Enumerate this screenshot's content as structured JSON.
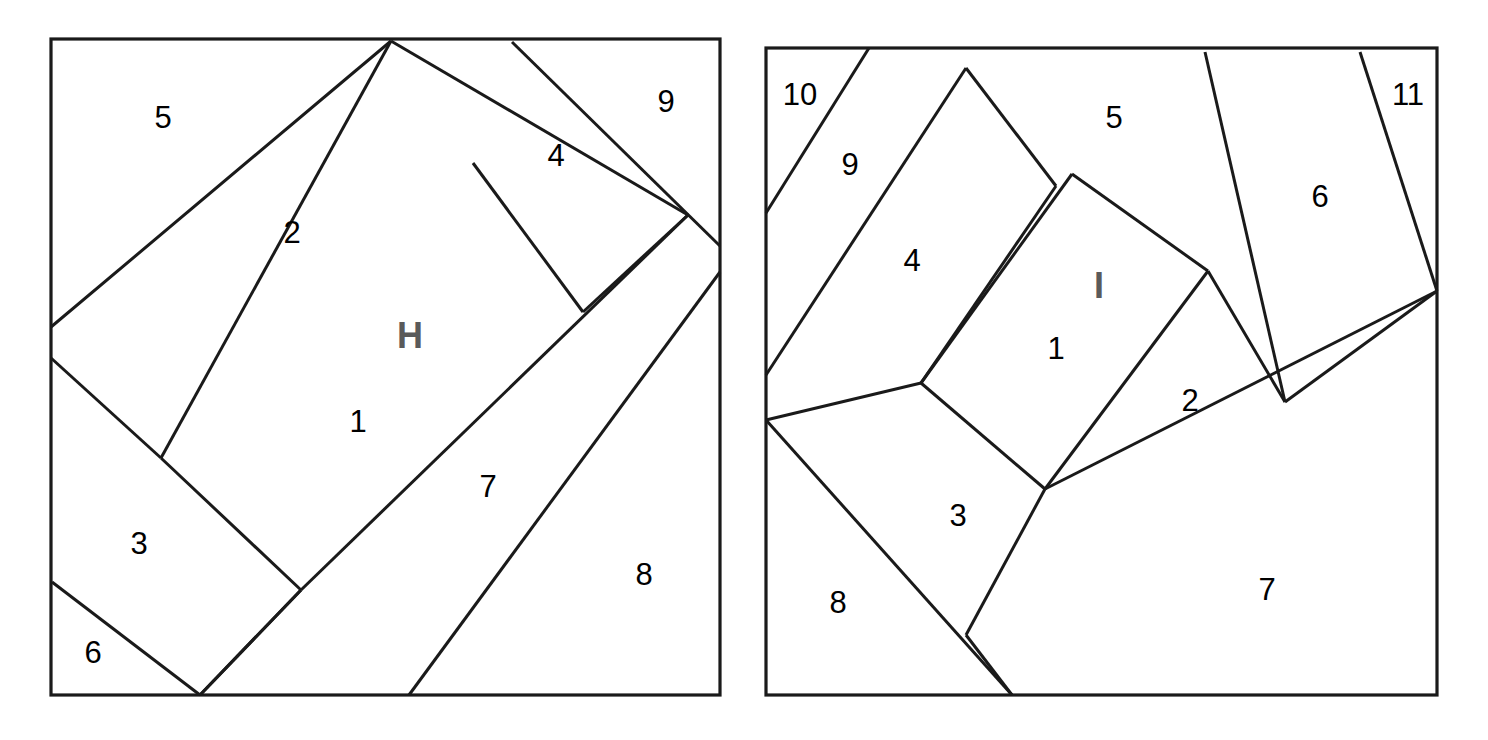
{
  "page": {
    "background": "#ffffff",
    "line_color": "#1a1a1a",
    "label_color": "#000000",
    "figure_letter_color": "#5a5a5a",
    "width": 1488,
    "height": 740
  },
  "figures": [
    {
      "id": "figure-h",
      "letter": "H",
      "letter_pos": [
        410,
        338
      ],
      "frame": {
        "x": 51,
        "y": 39,
        "w": 669,
        "h": 656
      },
      "piece_count": 9,
      "labels": [
        {
          "n": "1",
          "x": 358,
          "y": 424
        },
        {
          "n": "2",
          "x": 292,
          "y": 235
        },
        {
          "n": "3",
          "x": 139,
          "y": 546
        },
        {
          "n": "4",
          "x": 556,
          "y": 158
        },
        {
          "n": "5",
          "x": 163,
          "y": 120
        },
        {
          "n": "6",
          "x": 93,
          "y": 655
        },
        {
          "n": "7",
          "x": 488,
          "y": 489
        },
        {
          "n": "8",
          "x": 644,
          "y": 577
        },
        {
          "n": "9",
          "x": 666,
          "y": 104
        }
      ],
      "cuts": [
        "M 51 327 L 391 41",
        "M 51 358 L 161 458",
        "M 161 458 L 301 590",
        "M 391 41 L 161 458",
        "M 301 590 L 200 695",
        "M 52 582 L 200 695",
        "M 391 41 L 688 215",
        "M 473 163 L 583 312",
        "M 583 312 L 688 215",
        "M 512 42 L 720 246",
        "M 720 272 L 409 695",
        "M 688 215 L 301 590",
        "M 301 590 L 200 695"
      ]
    },
    {
      "id": "figure-i",
      "letter": "I",
      "letter_pos": [
        1099,
        288
      ],
      "frame": {
        "x": 766,
        "y": 48,
        "w": 671,
        "h": 647
      },
      "piece_count": 11,
      "labels": [
        {
          "n": "1",
          "x": 1056,
          "y": 351
        },
        {
          "n": "2",
          "x": 1190,
          "y": 403
        },
        {
          "n": "3",
          "x": 958,
          "y": 518
        },
        {
          "n": "4",
          "x": 912,
          "y": 263
        },
        {
          "n": "5",
          "x": 1114,
          "y": 120
        },
        {
          "n": "6",
          "x": 1320,
          "y": 199
        },
        {
          "n": "7",
          "x": 1267,
          "y": 592
        },
        {
          "n": "8",
          "x": 838,
          "y": 605
        },
        {
          "n": "9",
          "x": 850,
          "y": 167
        },
        {
          "n": "10",
          "x": 800,
          "y": 97
        },
        {
          "n": "11",
          "x": 1408,
          "y": 97
        }
      ],
      "cuts": [
        "M 766 213 L 869 48",
        "M 766 375 L 966 68",
        "M 966 68 L 1056 186",
        "M 921 383 L 1072 174",
        "M 1072 174 L 1208 271",
        "M 766 420 L 921 383",
        "M 921 383 L 1045 489",
        "M 1045 489 L 1208 271",
        "M 1056 186 L 921 383",
        "M 766 420 L 1012 695",
        "M 1045 489 L 966 635",
        "M 966 635 L 1012 695",
        "M 1208 271 L 1285 402",
        "M 1205 52 L 1285 402",
        "M 1285 402 L 1437 291",
        "M 1360 52 L 1437 291",
        "M 1045 489 L 1437 291"
      ]
    }
  ]
}
